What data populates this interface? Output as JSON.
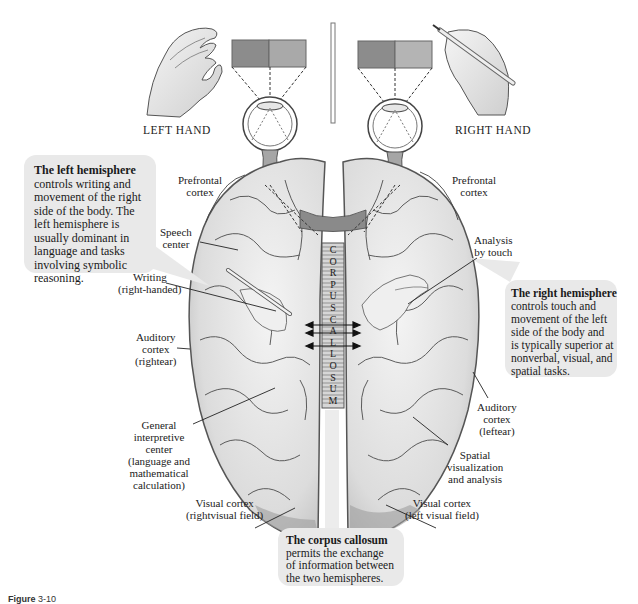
{
  "figure": {
    "caption_prefix": "Figure",
    "caption_number": "3-10"
  },
  "top": {
    "left_hand_label": "LEFT HAND",
    "right_hand_label": "RIGHT HAND",
    "colors": {
      "left_screen_dark": "#8c8c8c",
      "left_screen_light": "#a9a9a9",
      "right_screen_dark": "#8c8c8c",
      "right_screen_light": "#b4b4b4"
    }
  },
  "callouts": {
    "left": {
      "heading": "The left hemisphere",
      "lines": [
        "controls writing and",
        "movement of the right",
        "side of the body. The",
        "left hemisphere is",
        "usually dominant in",
        "language and tasks",
        "involving symbolic",
        "reasoning."
      ]
    },
    "right": {
      "heading": "The right hemisphere",
      "lines": [
        "controls touch and",
        "movement of the left",
        " side of the body and",
        "is typically superior at",
        "nonverbal, visual, and",
        "spatial tasks."
      ]
    },
    "corpus": {
      "heading": "The corpus callosum",
      "lines": [
        "permits the exchange",
        "of information between",
        "the two hemispheres."
      ]
    },
    "background": "#e9e9e9"
  },
  "labels": {
    "left": {
      "prefrontal": [
        "Prefrontal",
        "cortex"
      ],
      "speech": [
        "Speech",
        "center"
      ],
      "writing": [
        "Writing",
        "(right-handed)"
      ],
      "auditory": [
        "Auditory",
        "cortex",
        "(rightear)"
      ],
      "interpretive": [
        "General",
        "interpretive",
        "center",
        "(language and",
        "mathematical",
        "calculation)"
      ],
      "visual": [
        "Visual cortex",
        "(rightvisual field)"
      ]
    },
    "right": {
      "prefrontal": [
        "Prefrontal",
        "cortex"
      ],
      "touch": [
        "Analysis",
        "by touch"
      ],
      "auditory": [
        "Auditory",
        "cortex",
        "(leftear)"
      ],
      "spatial": [
        "Spatial",
        "visualization",
        "and analysis"
      ],
      "visual": [
        "Visual cortex",
        "(left visual field)"
      ]
    },
    "corpus_letters": [
      "C",
      "O",
      "R",
      "P",
      "U",
      "S",
      "C",
      "A",
      "L",
      "L",
      "O",
      "S",
      "U",
      "M"
    ]
  },
  "brain_colors": {
    "fill": "#e4e4e4",
    "shade": "#c8c8c8",
    "outline": "#555555",
    "sulci": "#3a3a3a",
    "corpus": "#d6d6d6"
  }
}
